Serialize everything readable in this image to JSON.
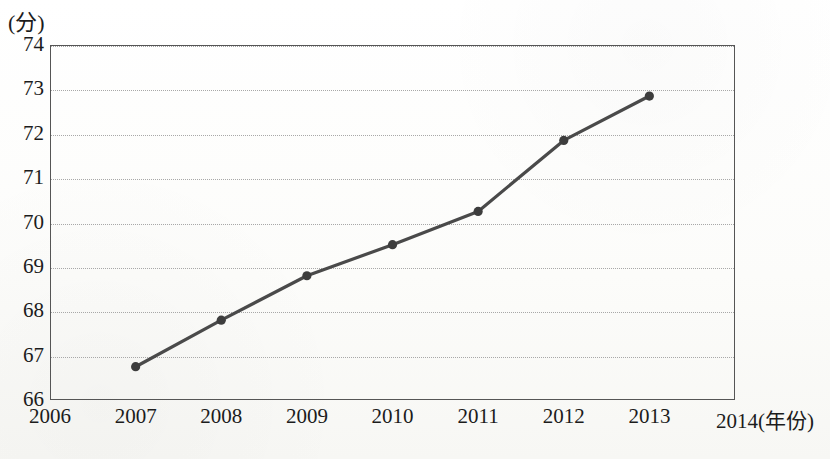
{
  "chart_data": {
    "type": "line",
    "title": "",
    "xlabel": "(年份)",
    "ylabel": "(分)",
    "x": [
      2007,
      2008,
      2009,
      2010,
      2011,
      2012,
      2013
    ],
    "values": [
      66.75,
      67.8,
      68.8,
      69.5,
      70.25,
      71.85,
      72.85
    ],
    "series": [
      {
        "name": "",
        "values": [
          66.75,
          67.8,
          68.8,
          69.5,
          70.25,
          71.85,
          72.85
        ]
      }
    ],
    "x_tick_labels": [
      "2006",
      "2007",
      "2008",
      "2009",
      "2010",
      "2011",
      "2012",
      "2013",
      "2014"
    ],
    "y_tick_labels": [
      "66",
      "67",
      "68",
      "69",
      "70",
      "71",
      "72",
      "73",
      "74"
    ],
    "xlim": [
      2006,
      2014
    ],
    "ylim": [
      66,
      74
    ],
    "grid": true,
    "legend": "none",
    "marker": "circle",
    "line_color": "#4a4a4a",
    "marker_color": "#3d3d3d",
    "grid_color": "#a8a8a8",
    "frame_color": "#555555",
    "x_axis_unit_suffix": "(年份)",
    "x_axis_last_label_full": "2014(年份)"
  }
}
